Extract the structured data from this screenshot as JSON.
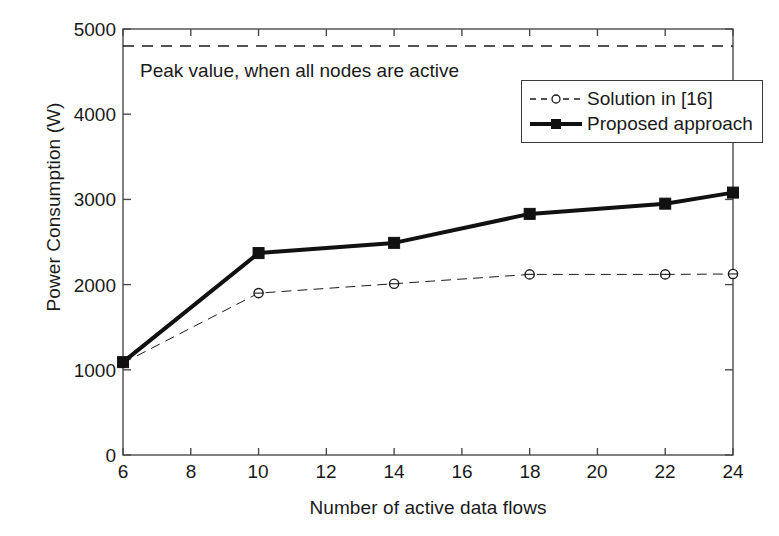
{
  "chart_data": {
    "type": "line",
    "title": "",
    "xlabel": "Number of active data flows",
    "ylabel": "Power Consumption (W)",
    "xlim": [
      6,
      24
    ],
    "ylim": [
      0,
      5000
    ],
    "xticks": [
      6,
      8,
      10,
      12,
      14,
      16,
      18,
      20,
      22,
      24
    ],
    "yticks": [
      0,
      1000,
      2000,
      3000,
      4000,
      5000
    ],
    "grid": false,
    "legend_position": "upper right",
    "x": [
      6,
      10,
      14,
      18,
      22,
      24
    ],
    "series": [
      {
        "name": "Solution in [16]",
        "values": [
          1080,
          1900,
          2010,
          2120,
          2120,
          2125
        ],
        "style": "dashed",
        "marker": "circle",
        "color": "#1a1a1a",
        "linewidth": 1
      },
      {
        "name": "Proposed approach",
        "values": [
          1090,
          2370,
          2490,
          2830,
          2950,
          3080
        ],
        "style": "solid",
        "marker": "square",
        "color": "#111111",
        "linewidth": 4
      }
    ],
    "reference_lines": [
      {
        "name": "peak-value-line",
        "value": 4800,
        "style": "dashed",
        "label": "Peak value, when all nodes are active"
      }
    ],
    "annotations": [
      {
        "text": "Peak value, when all nodes are active",
        "x": 7.2,
        "y": 4450
      }
    ]
  },
  "legend": {
    "items": [
      {
        "label": "Solution in [16]"
      },
      {
        "label": "Proposed approach"
      }
    ]
  },
  "axes": {
    "x_tick_labels": [
      "6",
      "8",
      "10",
      "12",
      "14",
      "16",
      "18",
      "20",
      "22",
      "24"
    ],
    "y_tick_labels": [
      "0",
      "1000",
      "2000",
      "3000",
      "4000",
      "5000"
    ],
    "xlabel": "Number of active data flows",
    "ylabel": "Power Consumption (W)"
  },
  "colors": {
    "axis": "#4a4a4a",
    "series_1": "#1a1a1a",
    "series_2": "#111111",
    "background": "#ffffff"
  }
}
